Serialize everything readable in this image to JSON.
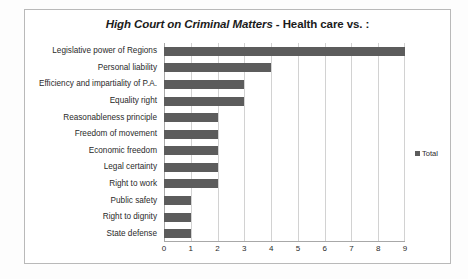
{
  "chart_data": {
    "type": "bar",
    "orientation": "horizontal",
    "title": "High Court on Criminal Matters - Health care vs. :",
    "title_italic_part": "High Court on Criminal Matters",
    "title_plain_part": " - Health care vs. :",
    "xlabel": "",
    "ylabel": "",
    "xlim": [
      0,
      9
    ],
    "xticks": [
      "0",
      "1",
      "2",
      "3",
      "4",
      "5",
      "6",
      "7",
      "8",
      "9"
    ],
    "grid": true,
    "legend_position": "right",
    "legend": [
      "Total"
    ],
    "bar_color": "#5c5c5c",
    "categories": [
      "Legislative power of Regions",
      "Personal liability",
      "Efficiency and impartiality of P.A.",
      "Equality right",
      "Reasonableness principle",
      "Freedom of movement",
      "Economic freedom",
      "Legal certainty",
      "Right to work",
      "Public safety",
      "Right to dignity",
      "State defense"
    ],
    "series": [
      {
        "name": "Total",
        "values": [
          9,
          4,
          3,
          3,
          2,
          2,
          2,
          2,
          2,
          1,
          1,
          1
        ]
      }
    ]
  },
  "colors": {
    "bar": "#5c5c5c",
    "gridline": "#d2d2d2",
    "axis": "#a8a8a8",
    "frame_border": "#b9b9b9",
    "text": "#2a2a2a"
  }
}
